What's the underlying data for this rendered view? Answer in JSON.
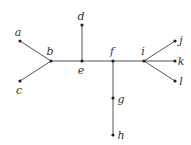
{
  "diagram": {
    "type": "tree",
    "edge_color": "#555555",
    "node_color": "#222222",
    "nodes": [
      {
        "id": "a",
        "label": "a",
        "x": 20,
        "y": 41,
        "lx": 18,
        "ly": 32
      },
      {
        "id": "b",
        "label": "b",
        "x": 51,
        "y": 61,
        "lx": 50,
        "ly": 51
      },
      {
        "id": "c",
        "label": "c",
        "x": 20,
        "y": 81,
        "lx": 19,
        "ly": 90
      },
      {
        "id": "d",
        "label": "d",
        "x": 82,
        "y": 25,
        "lx": 81,
        "ly": 16
      },
      {
        "id": "e",
        "label": "e",
        "x": 82,
        "y": 61,
        "lx": 81,
        "ly": 70
      },
      {
        "id": "f",
        "label": "f",
        "x": 113,
        "y": 61,
        "lx": 112,
        "ly": 51
      },
      {
        "id": "g",
        "label": "g",
        "x": 113,
        "y": 98,
        "lx": 121,
        "ly": 99
      },
      {
        "id": "h",
        "label": "h",
        "x": 113,
        "y": 135,
        "lx": 121,
        "ly": 135
      },
      {
        "id": "i",
        "label": "i",
        "x": 144,
        "y": 61,
        "lx": 143,
        "ly": 51
      },
      {
        "id": "j",
        "label": "j",
        "x": 175,
        "y": 41,
        "lx": 181,
        "ly": 40
      },
      {
        "id": "k",
        "label": "k",
        "x": 175,
        "y": 61,
        "lx": 181,
        "ly": 61
      },
      {
        "id": "l",
        "label": "l",
        "x": 175,
        "y": 81,
        "lx": 181,
        "ly": 81
      }
    ],
    "edges": [
      [
        "a",
        "b"
      ],
      [
        "c",
        "b"
      ],
      [
        "b",
        "e"
      ],
      [
        "d",
        "e"
      ],
      [
        "e",
        "f"
      ],
      [
        "f",
        "g"
      ],
      [
        "g",
        "h"
      ],
      [
        "f",
        "i"
      ],
      [
        "i",
        "j"
      ],
      [
        "i",
        "k"
      ],
      [
        "i",
        "l"
      ]
    ]
  }
}
